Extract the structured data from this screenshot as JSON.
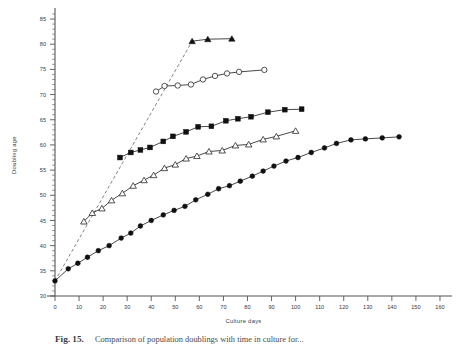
{
  "figure": {
    "name": "doubling-age-vs-culture-days",
    "caption_label": "Fig. 15.",
    "caption_text": "Comparison of population doublings with time in culture for..."
  },
  "chart_data": {
    "type": "line",
    "title": "",
    "xlabel": "Culture    days",
    "ylabel": "Doubling    age",
    "xlim": [
      0,
      165
    ],
    "ylim": [
      30,
      86
    ],
    "grid": false,
    "legend": "none",
    "xticks": [
      0,
      10,
      20,
      30,
      40,
      50,
      60,
      70,
      80,
      90,
      100,
      110,
      120,
      130,
      140,
      150,
      160
    ],
    "yticks": [
      30,
      35,
      40,
      45,
      50,
      55,
      60,
      65,
      70,
      75,
      80,
      85
    ],
    "xtick_labels": [
      "0",
      "10",
      "20",
      "30",
      "40",
      "50",
      "60",
      "70",
      "80",
      "90",
      "100",
      "110",
      "120",
      "130",
      "140",
      "150",
      "160"
    ],
    "ytick_labels": [
      "30",
      "35",
      "40",
      "45",
      "50",
      "55",
      "60",
      "65",
      "70",
      "75",
      "80",
      "85"
    ],
    "x_minor_step": 2,
    "y_minor_step": 1,
    "series": [
      {
        "name": "dashed-extrapolation",
        "marker": "none",
        "line": "dashed",
        "color": "#5a5a5a",
        "points": [
          [
            0,
            33.0
          ],
          [
            57,
            80.6
          ]
        ]
      },
      {
        "name": "filled-triangles",
        "marker": "triangle-filled",
        "line": "solid",
        "color": "#101010",
        "points": [
          [
            57,
            80.6
          ],
          [
            63.5,
            81.0
          ],
          [
            73.5,
            81.1
          ]
        ]
      },
      {
        "name": "open-circles",
        "marker": "circle-open",
        "line": "solid",
        "color": "#1b1b1b",
        "points": [
          [
            42,
            70.6
          ],
          [
            45.5,
            71.7
          ],
          [
            51,
            71.8
          ],
          [
            56.5,
            72.0
          ],
          [
            61.5,
            73.0
          ],
          [
            66.5,
            73.7
          ],
          [
            71.5,
            74.2
          ],
          [
            76.5,
            74.5
          ],
          [
            87,
            74.9
          ]
        ]
      },
      {
        "name": "filled-squares",
        "marker": "square-filled",
        "line": "solid",
        "color": "#101010",
        "points": [
          [
            27,
            57.5
          ],
          [
            31.5,
            58.5
          ],
          [
            35.5,
            59.0
          ],
          [
            39.5,
            59.5
          ],
          [
            45,
            60.7
          ],
          [
            49,
            61.7
          ],
          [
            54.5,
            62.6
          ],
          [
            59.5,
            63.6
          ],
          [
            65,
            63.7
          ],
          [
            71,
            64.8
          ],
          [
            76,
            65.2
          ],
          [
            81.5,
            65.6
          ],
          [
            88.5,
            66.5
          ],
          [
            95.5,
            67.0
          ],
          [
            102.5,
            67.1
          ]
        ]
      },
      {
        "name": "open-triangles",
        "marker": "triangle-open",
        "line": "solid",
        "color": "#1b1b1b",
        "points": [
          [
            12,
            44.8
          ],
          [
            15.5,
            46.5
          ],
          [
            19.5,
            47.4
          ],
          [
            23.5,
            49.0
          ],
          [
            28,
            50.4
          ],
          [
            32.5,
            51.9
          ],
          [
            37,
            53.0
          ],
          [
            41,
            54.0
          ],
          [
            45.5,
            55.4
          ],
          [
            50,
            56.1
          ],
          [
            54.5,
            57.3
          ],
          [
            59,
            57.8
          ],
          [
            64,
            58.7
          ],
          [
            69.5,
            58.9
          ],
          [
            75,
            59.9
          ],
          [
            80.5,
            60.1
          ],
          [
            86.5,
            61.1
          ],
          [
            92,
            61.7
          ],
          [
            100,
            62.8
          ]
        ]
      },
      {
        "name": "filled-circles",
        "marker": "circle-filled",
        "line": "solid",
        "color": "#101010",
        "points": [
          [
            0,
            33.0
          ],
          [
            5.5,
            35.4
          ],
          [
            9.5,
            36.5
          ],
          [
            13.5,
            37.7
          ],
          [
            18,
            39.0
          ],
          [
            22.5,
            40.0
          ],
          [
            27.5,
            41.5
          ],
          [
            31.5,
            42.5
          ],
          [
            35.5,
            43.9
          ],
          [
            40,
            45.0
          ],
          [
            45,
            46.1
          ],
          [
            49.5,
            47.0
          ],
          [
            54,
            47.8
          ],
          [
            58.5,
            49.1
          ],
          [
            63.5,
            50.2
          ],
          [
            68,
            51.3
          ],
          [
            72.5,
            51.9
          ],
          [
            77,
            52.8
          ],
          [
            82,
            53.8
          ],
          [
            86.5,
            54.8
          ],
          [
            91,
            55.8
          ],
          [
            96,
            56.8
          ],
          [
            101,
            57.5
          ],
          [
            106.5,
            58.5
          ],
          [
            112,
            59.4
          ],
          [
            117,
            60.3
          ],
          [
            123,
            61.0
          ],
          [
            129,
            61.2
          ],
          [
            136,
            61.4
          ],
          [
            143,
            61.6
          ]
        ]
      }
    ]
  }
}
